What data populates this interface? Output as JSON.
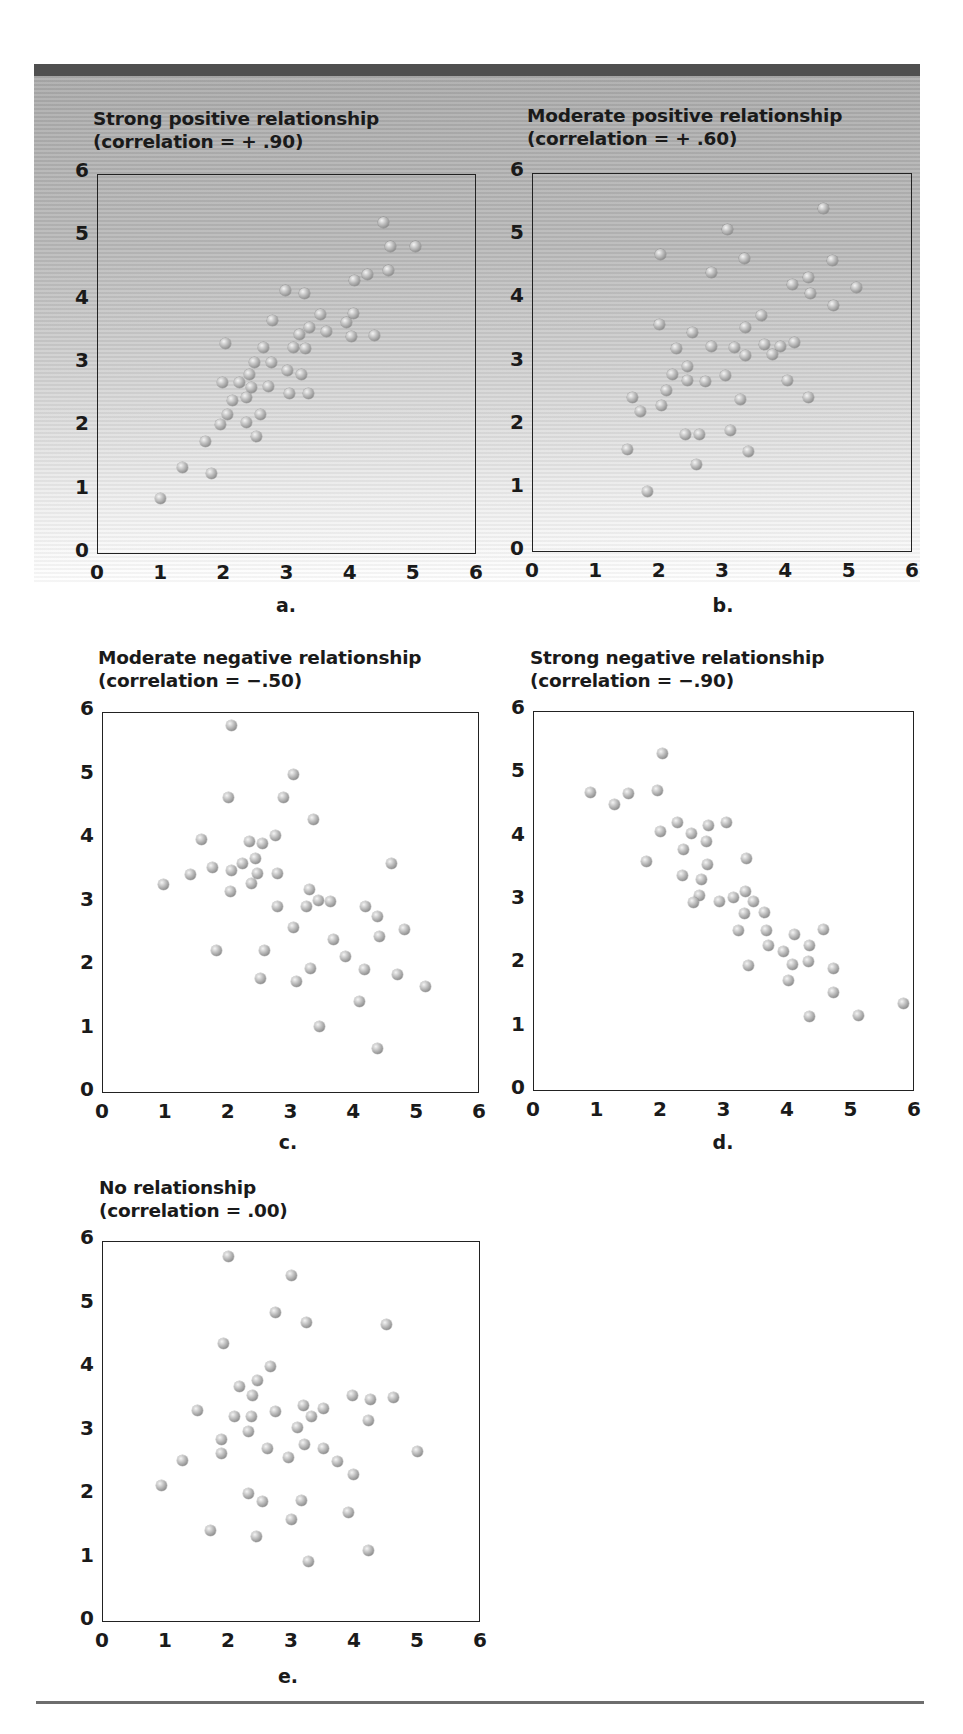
{
  "chart_data": [
    {
      "type": "scatter",
      "panel": "a",
      "title": "Strong positive relationship",
      "subtitle": "(correlation = + .90)",
      "correlation": 0.9,
      "caption": "a.",
      "xlabel": "",
      "ylabel": "",
      "xlim": [
        0,
        6
      ],
      "ylim": [
        0,
        6
      ],
      "xticks": [
        "0",
        "1",
        "2",
        "3",
        "4",
        "5",
        "6"
      ],
      "yticks": [
        "0",
        "1",
        "2",
        "3",
        "4",
        "5",
        "6"
      ],
      "grid": false,
      "points": [
        [
          4.54,
          5.24
        ],
        [
          4.65,
          4.86
        ],
        [
          5.05,
          4.85
        ],
        [
          4.61,
          4.47
        ],
        [
          4.28,
          4.41
        ],
        [
          4.07,
          4.32
        ],
        [
          2.98,
          4.16
        ],
        [
          3.29,
          4.12
        ],
        [
          3.54,
          3.78
        ],
        [
          4.06,
          3.8
        ],
        [
          2.78,
          3.68
        ],
        [
          3.95,
          3.65
        ],
        [
          3.37,
          3.57
        ],
        [
          3.63,
          3.51
        ],
        [
          3.21,
          3.46
        ],
        [
          4.03,
          3.43
        ],
        [
          4.4,
          3.45
        ],
        [
          2.03,
          3.33
        ],
        [
          2.64,
          3.26
        ],
        [
          3.11,
          3.26
        ],
        [
          3.3,
          3.24
        ],
        [
          2.5,
          3.02
        ],
        [
          2.77,
          3.03
        ],
        [
          3.01,
          2.9
        ],
        [
          3.23,
          2.83
        ],
        [
          2.42,
          2.83
        ],
        [
          1.99,
          2.71
        ],
        [
          2.25,
          2.71
        ],
        [
          2.44,
          2.63
        ],
        [
          2.71,
          2.64
        ],
        [
          3.05,
          2.53
        ],
        [
          3.35,
          2.53
        ],
        [
          2.37,
          2.47
        ],
        [
          2.15,
          2.42
        ],
        [
          2.59,
          2.21
        ],
        [
          2.06,
          2.2
        ],
        [
          2.37,
          2.07
        ],
        [
          1.96,
          2.04
        ],
        [
          2.53,
          1.86
        ],
        [
          1.71,
          1.77
        ],
        [
          1.36,
          1.37
        ],
        [
          1.82,
          1.27
        ],
        [
          1.0,
          0.87
        ]
      ]
    },
    {
      "type": "scatter",
      "panel": "b",
      "title": "Moderate positive relationship",
      "subtitle": "(correlation = + .60)",
      "correlation": 0.6,
      "caption": "b.",
      "xlabel": "",
      "ylabel": "",
      "xlim": [
        0,
        6
      ],
      "ylim": [
        0,
        6
      ],
      "xticks": [
        "0",
        "1",
        "2",
        "3",
        "4",
        "5",
        "6"
      ],
      "yticks": [
        "0",
        "1",
        "2",
        "3",
        "4",
        "5",
        "6"
      ],
      "grid": false,
      "points": [
        [
          4.61,
          5.44
        ],
        [
          3.08,
          5.1
        ],
        [
          2.03,
          4.71
        ],
        [
          3.35,
          4.64
        ],
        [
          4.75,
          4.62
        ],
        [
          2.84,
          4.42
        ],
        [
          4.36,
          4.35
        ],
        [
          4.11,
          4.23
        ],
        [
          4.4,
          4.1
        ],
        [
          5.12,
          4.19
        ],
        [
          4.76,
          3.91
        ],
        [
          3.63,
          3.74
        ],
        [
          2.02,
          3.6
        ],
        [
          3.37,
          3.55
        ],
        [
          2.54,
          3.47
        ],
        [
          2.28,
          3.22
        ],
        [
          2.84,
          3.26
        ],
        [
          3.2,
          3.23
        ],
        [
          3.67,
          3.29
        ],
        [
          3.93,
          3.26
        ],
        [
          4.15,
          3.31
        ],
        [
          3.37,
          3.11
        ],
        [
          3.79,
          3.13
        ],
        [
          2.45,
          2.94
        ],
        [
          2.22,
          2.81
        ],
        [
          2.45,
          2.72
        ],
        [
          2.74,
          2.7
        ],
        [
          3.06,
          2.8
        ],
        [
          4.03,
          2.72
        ],
        [
          2.12,
          2.56
        ],
        [
          1.59,
          2.44
        ],
        [
          2.04,
          2.32
        ],
        [
          1.72,
          2.23
        ],
        [
          3.29,
          2.41
        ],
        [
          4.37,
          2.44
        ],
        [
          2.42,
          1.86
        ],
        [
          2.65,
          1.86
        ],
        [
          3.13,
          1.92
        ],
        [
          1.51,
          1.62
        ],
        [
          3.42,
          1.59
        ],
        [
          2.59,
          1.38
        ],
        [
          1.83,
          0.96
        ]
      ]
    },
    {
      "type": "scatter",
      "panel": "c",
      "title": "Moderate negative relationship",
      "subtitle": "(correlation =  −.50)",
      "correlation": -0.5,
      "caption": "c.",
      "xlabel": "",
      "ylabel": "",
      "xlim": [
        0,
        6
      ],
      "ylim": [
        0,
        6
      ],
      "xticks": [
        "0",
        "1",
        "2",
        "3",
        "4",
        "5",
        "6"
      ],
      "yticks": [
        "0",
        "1",
        "2",
        "3",
        "4",
        "5",
        "6"
      ],
      "grid": false,
      "points": [
        [
          2.06,
          5.79
        ],
        [
          3.04,
          5.01
        ],
        [
          2.02,
          4.65
        ],
        [
          2.89,
          4.65
        ],
        [
          3.37,
          4.3
        ],
        [
          1.59,
          4.0
        ],
        [
          2.34,
          3.96
        ],
        [
          2.55,
          3.93
        ],
        [
          2.76,
          4.06
        ],
        [
          2.45,
          3.7
        ],
        [
          2.24,
          3.62
        ],
        [
          1.76,
          3.55
        ],
        [
          2.06,
          3.5
        ],
        [
          2.47,
          3.45
        ],
        [
          2.8,
          3.45
        ],
        [
          1.41,
          3.44
        ],
        [
          2.38,
          3.3
        ],
        [
          0.98,
          3.29
        ],
        [
          4.6,
          3.62
        ],
        [
          2.04,
          3.18
        ],
        [
          3.3,
          3.2
        ],
        [
          3.44,
          3.03
        ],
        [
          3.63,
          3.01
        ],
        [
          2.79,
          2.94
        ],
        [
          3.26,
          2.94
        ],
        [
          4.2,
          2.94
        ],
        [
          4.38,
          2.78
        ],
        [
          3.05,
          2.61
        ],
        [
          4.82,
          2.58
        ],
        [
          4.42,
          2.46
        ],
        [
          3.68,
          2.42
        ],
        [
          1.82,
          2.25
        ],
        [
          2.58,
          2.25
        ],
        [
          3.87,
          2.15
        ],
        [
          3.32,
          1.96
        ],
        [
          4.17,
          1.94
        ],
        [
          4.71,
          1.87
        ],
        [
          2.53,
          1.81
        ],
        [
          3.1,
          1.75
        ],
        [
          5.15,
          1.67
        ],
        [
          4.1,
          1.44
        ],
        [
          3.46,
          1.04
        ],
        [
          4.39,
          0.7
        ]
      ]
    },
    {
      "type": "scatter",
      "panel": "d",
      "title": "Strong negative relationship",
      "subtitle": "(correlation =  −.90)",
      "correlation": -0.9,
      "caption": "d.",
      "xlabel": "",
      "ylabel": "",
      "xlim": [
        0,
        6
      ],
      "ylim": [
        0,
        6
      ],
      "xticks": [
        "0",
        "1",
        "2",
        "3",
        "4",
        "5",
        "6"
      ],
      "yticks": [
        "0",
        "1",
        "2",
        "3",
        "4",
        "5",
        "6"
      ],
      "grid": false,
      "points": [
        [
          0.91,
          4.71
        ],
        [
          1.28,
          4.52
        ],
        [
          1.5,
          4.7
        ],
        [
          1.96,
          4.75
        ],
        [
          2.04,
          5.33
        ],
        [
          2.27,
          4.24
        ],
        [
          2.01,
          4.09
        ],
        [
          2.49,
          4.06
        ],
        [
          2.76,
          4.19
        ],
        [
          3.05,
          4.24
        ],
        [
          2.74,
          3.94
        ],
        [
          2.37,
          3.81
        ],
        [
          1.78,
          3.63
        ],
        [
          2.75,
          3.58
        ],
        [
          3.36,
          3.67
        ],
        [
          2.36,
          3.4
        ],
        [
          2.66,
          3.34
        ],
        [
          2.62,
          3.08
        ],
        [
          2.52,
          2.98
        ],
        [
          2.94,
          3.0
        ],
        [
          3.16,
          3.06
        ],
        [
          3.34,
          3.15
        ],
        [
          3.47,
          2.99
        ],
        [
          3.33,
          2.81
        ],
        [
          3.65,
          2.82
        ],
        [
          3.23,
          2.54
        ],
        [
          3.67,
          2.53
        ],
        [
          4.12,
          2.47
        ],
        [
          4.58,
          2.55
        ],
        [
          3.71,
          2.3
        ],
        [
          3.95,
          2.2
        ],
        [
          4.35,
          2.3
        ],
        [
          4.34,
          2.05
        ],
        [
          3.4,
          1.98
        ],
        [
          4.09,
          1.99
        ],
        [
          4.73,
          1.94
        ],
        [
          4.02,
          1.74
        ],
        [
          4.73,
          1.56
        ],
        [
          5.83,
          1.38
        ],
        [
          4.35,
          1.18
        ],
        [
          5.12,
          1.19
        ]
      ]
    },
    {
      "type": "scatter",
      "panel": "e",
      "title": "No relationship",
      "subtitle": "(correlation =  .00)",
      "correlation": 0.0,
      "caption": "e.",
      "xlabel": "",
      "ylabel": "",
      "xlim": [
        0,
        6
      ],
      "ylim": [
        0,
        6
      ],
      "xticks": [
        "0",
        "1",
        "2",
        "3",
        "4",
        "5",
        "6"
      ],
      "yticks": [
        "0",
        "1",
        "2",
        "3",
        "4",
        "5",
        "6"
      ],
      "grid": false,
      "points": [
        [
          2.0,
          5.76
        ],
        [
          3.0,
          5.45
        ],
        [
          2.75,
          4.88
        ],
        [
          3.25,
          4.71
        ],
        [
          4.52,
          4.68
        ],
        [
          1.93,
          4.38
        ],
        [
          2.67,
          4.03
        ],
        [
          2.47,
          3.81
        ],
        [
          2.19,
          3.71
        ],
        [
          2.39,
          3.56
        ],
        [
          3.98,
          3.56
        ],
        [
          4.26,
          3.5
        ],
        [
          4.63,
          3.54
        ],
        [
          1.51,
          3.33
        ],
        [
          3.2,
          3.41
        ],
        [
          3.51,
          3.37
        ],
        [
          2.76,
          3.31
        ],
        [
          2.1,
          3.23
        ],
        [
          2.37,
          3.24
        ],
        [
          3.32,
          3.23
        ],
        [
          4.23,
          3.17
        ],
        [
          3.1,
          3.07
        ],
        [
          2.33,
          3.0
        ],
        [
          1.9,
          2.88
        ],
        [
          3.22,
          2.8
        ],
        [
          2.62,
          2.74
        ],
        [
          3.51,
          2.74
        ],
        [
          1.9,
          2.65
        ],
        [
          5.01,
          2.69
        ],
        [
          2.96,
          2.59
        ],
        [
          1.28,
          2.54
        ],
        [
          3.74,
          2.52
        ],
        [
          3.99,
          2.33
        ],
        [
          0.94,
          2.15
        ],
        [
          2.33,
          2.02
        ],
        [
          2.54,
          1.9
        ],
        [
          3.17,
          1.92
        ],
        [
          3.91,
          1.73
        ],
        [
          3.01,
          1.61
        ],
        [
          1.73,
          1.44
        ],
        [
          2.46,
          1.35
        ],
        [
          4.23,
          1.12
        ],
        [
          3.28,
          0.95
        ]
      ]
    }
  ],
  "panels": {
    "a": {
      "title": "Strong positive relationship",
      "subtitle": "(correlation = + .90)",
      "caption": "a."
    },
    "b": {
      "title": "Moderate positive relationship",
      "subtitle": "(correlation = + .60)",
      "caption": "b."
    },
    "c": {
      "title": "Moderate negative relationship",
      "subtitle": "(correlation =  −.50)",
      "caption": "c."
    },
    "d": {
      "title": "Strong negative relationship",
      "subtitle": "(correlation =  −.90)",
      "caption": "d."
    },
    "e": {
      "title": "No relationship",
      "subtitle": "(correlation =  .00)",
      "caption": "e."
    }
  },
  "colors": {
    "top_bar": "#4f4f4f",
    "axis": "#222222",
    "text": "#1a1a1a",
    "dot": "#a8a8a8",
    "bottom_rule": "#6d6d6d"
  }
}
